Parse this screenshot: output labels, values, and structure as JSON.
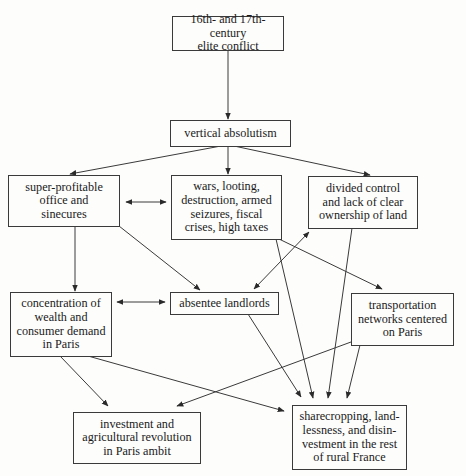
{
  "diagram": {
    "type": "flowchart",
    "nodes": [
      {
        "id": "elite_conflict",
        "label": "16th- and 17th-century\nelite conflict"
      },
      {
        "id": "vertical_absolutism",
        "label": "vertical absolutism"
      },
      {
        "id": "super_profitable",
        "label": "super-profitable\noffice and\nsinecures"
      },
      {
        "id": "wars",
        "label": "wars, looting,\ndestruction, armed\nseizures, fiscal\ncrises, high taxes"
      },
      {
        "id": "divided_control",
        "label": "divided control\nand lack of clear\nownership of land"
      },
      {
        "id": "concentration",
        "label": "concentration of\nwealth and\nconsumer demand\nin Paris"
      },
      {
        "id": "absentee",
        "label": "absentee landlords"
      },
      {
        "id": "transportation",
        "label": "transportation\nnetworks centered\non Paris"
      },
      {
        "id": "investment",
        "label": "investment and\nagricultural revolution\nin Paris ambit"
      },
      {
        "id": "sharecropping",
        "label": "sharecropping, land-\nlessness, and disin-\nvestment in the rest\nof rural France"
      }
    ],
    "edges": [
      {
        "from": "elite_conflict",
        "to": "vertical_absolutism",
        "direction": "forward"
      },
      {
        "from": "vertical_absolutism",
        "to": "super_profitable",
        "direction": "forward"
      },
      {
        "from": "vertical_absolutism",
        "to": "wars",
        "direction": "forward"
      },
      {
        "from": "vertical_absolutism",
        "to": "divided_control",
        "direction": "forward"
      },
      {
        "from": "super_profitable",
        "to": "wars",
        "direction": "both"
      },
      {
        "from": "super_profitable",
        "to": "concentration",
        "direction": "forward"
      },
      {
        "from": "super_profitable",
        "to": "absentee",
        "direction": "forward"
      },
      {
        "from": "absentee",
        "to": "divided_control",
        "direction": "both"
      },
      {
        "from": "wars",
        "to": "transportation",
        "direction": "forward"
      },
      {
        "from": "wars",
        "to": "sharecropping",
        "direction": "forward"
      },
      {
        "from": "divided_control",
        "to": "sharecropping",
        "direction": "forward"
      },
      {
        "from": "concentration",
        "to": "absentee",
        "direction": "both"
      },
      {
        "from": "concentration",
        "to": "investment",
        "direction": "forward"
      },
      {
        "from": "concentration",
        "to": "sharecropping",
        "direction": "forward"
      },
      {
        "from": "absentee",
        "to": "sharecropping",
        "direction": "forward"
      },
      {
        "from": "transportation",
        "to": "investment",
        "direction": "forward"
      },
      {
        "from": "transportation",
        "to": "sharecropping",
        "direction": "forward"
      }
    ]
  },
  "colors": {
    "line": "#3a3a3a",
    "background": "#fdfdfc",
    "text": "#1a1a1a"
  }
}
